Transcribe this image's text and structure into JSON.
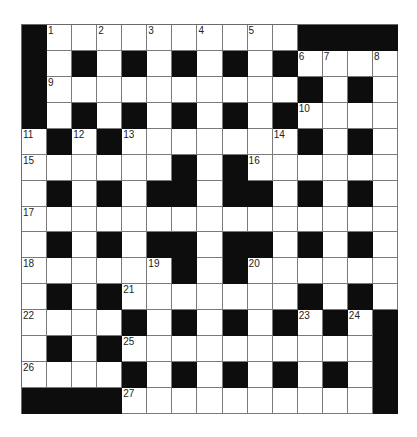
{
  "puzzle": {
    "rows": 15,
    "cols": 15,
    "colors": {
      "block": "#0d0d0d",
      "cell": "#ffffff",
      "line": "#7a7a7a",
      "number": "#222222"
    },
    "grid": [
      "#1.2.3.4.5.####",
      "#.#.#.#.#.#6789",
      "#9.........#.#.",
      "#.#.#.#.#.#A...",
      "B#C#D.....E#.#.",
      "F.....#.#G.....",
      ".#.#.##.##.#.#.",
      "H..............",
      ".#.#.##.##.#.#.",
      "I....J#.#K.....",
      ".#.#L......#.#.",
      "M...#.#.#.#N#O#",
      ".#.#P.........#",
      "Q...#.#.#.#.#.#",
      "####R.........#"
    ],
    "numbers": [
      {
        "row": 0,
        "col": 1,
        "n": "1"
      },
      {
        "row": 0,
        "col": 3,
        "n": "2"
      },
      {
        "row": 0,
        "col": 5,
        "n": "3"
      },
      {
        "row": 0,
        "col": 7,
        "n": "4"
      },
      {
        "row": 0,
        "col": 9,
        "n": "5"
      },
      {
        "row": 1,
        "col": 11,
        "n": "6"
      },
      {
        "row": 1,
        "col": 12,
        "n": "7"
      },
      {
        "row": 1,
        "col": 14,
        "n": "8"
      },
      {
        "row": 2,
        "col": 1,
        "n": "9"
      },
      {
        "row": 3,
        "col": 11,
        "n": "10"
      },
      {
        "row": 4,
        "col": 0,
        "n": "11"
      },
      {
        "row": 4,
        "col": 2,
        "n": "12"
      },
      {
        "row": 4,
        "col": 4,
        "n": "13"
      },
      {
        "row": 4,
        "col": 10,
        "n": "14"
      },
      {
        "row": 5,
        "col": 0,
        "n": "15"
      },
      {
        "row": 5,
        "col": 9,
        "n": "16"
      },
      {
        "row": 7,
        "col": 0,
        "n": "17"
      },
      {
        "row": 9,
        "col": 0,
        "n": "18"
      },
      {
        "row": 9,
        "col": 5,
        "n": "19"
      },
      {
        "row": 9,
        "col": 9,
        "n": "20"
      },
      {
        "row": 10,
        "col": 4,
        "n": "21"
      },
      {
        "row": 11,
        "col": 0,
        "n": "22"
      },
      {
        "row": 11,
        "col": 11,
        "n": "23"
      },
      {
        "row": 11,
        "col": 13,
        "n": "24"
      },
      {
        "row": 12,
        "col": 4,
        "n": "25"
      },
      {
        "row": 13,
        "col": 0,
        "n": "26"
      },
      {
        "row": 14,
        "col": 4,
        "n": "27"
      }
    ],
    "blocks": [
      [
        0,
        0
      ],
      [
        0,
        11
      ],
      [
        0,
        12
      ],
      [
        0,
        13
      ],
      [
        0,
        14
      ],
      [
        1,
        0
      ],
      [
        1,
        2
      ],
      [
        1,
        4
      ],
      [
        1,
        6
      ],
      [
        1,
        8
      ],
      [
        1,
        10
      ],
      [
        2,
        0
      ],
      [
        2,
        11
      ],
      [
        2,
        13
      ],
      [
        3,
        0
      ],
      [
        3,
        2
      ],
      [
        3,
        4
      ],
      [
        3,
        6
      ],
      [
        3,
        8
      ],
      [
        3,
        10
      ],
      [
        4,
        1
      ],
      [
        4,
        3
      ],
      [
        4,
        11
      ],
      [
        4,
        13
      ],
      [
        5,
        6
      ],
      [
        5,
        8
      ],
      [
        6,
        1
      ],
      [
        6,
        3
      ],
      [
        6,
        5
      ],
      [
        6,
        6
      ],
      [
        6,
        8
      ],
      [
        6,
        9
      ],
      [
        6,
        11
      ],
      [
        6,
        13
      ],
      [
        8,
        1
      ],
      [
        8,
        3
      ],
      [
        8,
        5
      ],
      [
        8,
        6
      ],
      [
        8,
        8
      ],
      [
        8,
        9
      ],
      [
        8,
        11
      ],
      [
        8,
        13
      ],
      [
        9,
        6
      ],
      [
        9,
        8
      ],
      [
        10,
        1
      ],
      [
        10,
        3
      ],
      [
        10,
        11
      ],
      [
        10,
        13
      ],
      [
        11,
        4
      ],
      [
        11,
        6
      ],
      [
        11,
        8
      ],
      [
        11,
        10
      ],
      [
        11,
        12
      ],
      [
        11,
        14
      ],
      [
        12,
        1
      ],
      [
        12,
        3
      ],
      [
        12,
        14
      ],
      [
        13,
        4
      ],
      [
        13,
        6
      ],
      [
        13,
        8
      ],
      [
        13,
        10
      ],
      [
        13,
        12
      ],
      [
        13,
        14
      ],
      [
        14,
        0
      ],
      [
        14,
        1
      ],
      [
        14,
        2
      ],
      [
        14,
        3
      ],
      [
        14,
        14
      ]
    ]
  }
}
